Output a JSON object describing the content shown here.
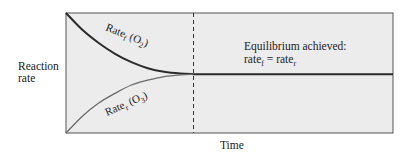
{
  "chart_data": {
    "type": "line",
    "title": "",
    "xlabel": "Time",
    "ylabel_lines": [
      "Reaction",
      "rate"
    ],
    "xlim": [
      0,
      1
    ],
    "ylim": [
      0,
      1
    ],
    "grid": false,
    "legend": "none",
    "equilibrium_time": 0.39,
    "equilibrium_rate": 0.49,
    "series": [
      {
        "name": "Rate_f(O2)",
        "label_main": "Rate",
        "label_sub": "f",
        "label_paren_open": " (O",
        "label_paren_sub": "2",
        "label_paren_close": ")",
        "color": "#2b2b2b",
        "x": [
          0,
          0.05,
          0.1,
          0.15,
          0.2,
          0.25,
          0.3,
          0.35,
          0.39,
          1.0
        ],
        "y": [
          1.0,
          0.86,
          0.75,
          0.66,
          0.59,
          0.54,
          0.51,
          0.495,
          0.49,
          0.49
        ]
      },
      {
        "name": "Rate_r(O3)",
        "label_main": "Rate",
        "label_sub": "r",
        "label_paren_open": " (O",
        "label_paren_sub": "3",
        "label_paren_close": ")",
        "color": "#6a6a6a",
        "x": [
          0,
          0.05,
          0.1,
          0.15,
          0.2,
          0.25,
          0.3,
          0.35,
          0.39
        ],
        "y": [
          0.0,
          0.14,
          0.25,
          0.33,
          0.4,
          0.44,
          0.47,
          0.485,
          0.49
        ]
      }
    ],
    "annotations": [
      {
        "line1": "Equilibrium achieved:",
        "line2_a": "rate",
        "line2_a_sub": "f",
        "line2_eq": " = rate",
        "line2_b_sub": "r"
      }
    ],
    "colors": {
      "plot_background": "#ececec",
      "frame": "#555555",
      "equilibrium_line": "#333333",
      "dashed_line": "#333333"
    }
  }
}
